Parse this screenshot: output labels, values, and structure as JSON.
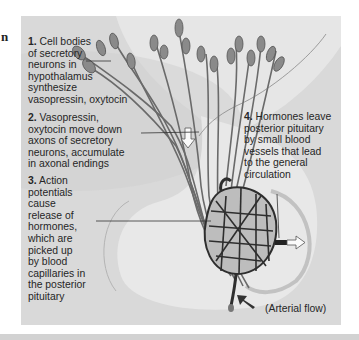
{
  "left_fragment": {
    "bold_text": "n",
    "small_text": ""
  },
  "diagram": {
    "labels": [
      {
        "number": "1.",
        "text": "Cell bodies of secretory neurons in hypothalamus synthesize vasopressin, oxytocin",
        "lines": [
          "Cell bodies",
          "of secretory",
          "neurons in",
          "hypothalamus",
          "synthesize",
          "vasopressin, oxytocin"
        ]
      },
      {
        "number": "2.",
        "text": "Vasopressin, oxytocin move down axons of secretory neurons, accumulate in axonal endings",
        "lines": [
          "Vasopressin,",
          "oxytocin move down",
          "axons of secretory",
          "neurons, accumulate",
          "in axonal endings"
        ]
      },
      {
        "number": "3.",
        "text": "Action potentials cause release of hormones, which are picked up by blood capillaries in the posterior pituitary",
        "lines": [
          "Action",
          "potentials",
          "cause",
          "release of",
          "hormones,",
          "which are",
          "picked up",
          "by blood",
          "capillaries in",
          "the posterior",
          "pituitary"
        ]
      },
      {
        "number": "4.",
        "text": "Hormones leave posterior pituitary by small blood vessels that lead to the general circulation",
        "lines": [
          "Hormones leave",
          "posterior pituitary",
          "by small blood",
          "vessels that lead",
          "to the general",
          "circulation"
        ]
      }
    ],
    "arterial_flow_label": "(Arterial flow)",
    "colors": {
      "panel": "#d9d9d9",
      "tissue_light": "#e9e9e9",
      "tissue_dark": "#c6c6c6",
      "neuron": "#6e6e6e",
      "capillary": "#3a3a3a"
    }
  }
}
